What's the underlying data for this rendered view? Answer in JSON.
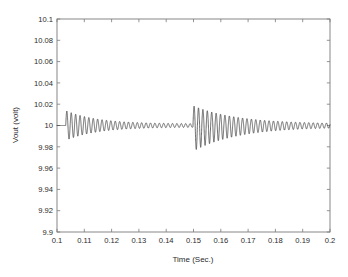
{
  "figure": {
    "background_color": "#ffffff",
    "axes_color": "#7a7a7a",
    "line_color": "#3a3a3a",
    "text_color": "#2b2b2b"
  },
  "chart_data": {
    "type": "line",
    "title": "",
    "xlabel": "Time (Sec.)",
    "ylabel": "Vout (volt)",
    "xlim": [
      0.1,
      0.2
    ],
    "ylim": [
      9.9,
      10.1
    ],
    "grid": false,
    "legend": null,
    "xticks": [
      0.1,
      0.11,
      0.12,
      0.13,
      0.14,
      0.15,
      0.16,
      0.17,
      0.18,
      0.19,
      0.2
    ],
    "xticklabels": [
      "0.1",
      "0.11",
      "0.12",
      "0.13",
      "0.14",
      "0.15",
      "0.16",
      "0.17",
      "0.18",
      "0.19",
      "0.2"
    ],
    "yticks": [
      9.9,
      9.92,
      9.94,
      9.96,
      9.98,
      10,
      10.02,
      10.04,
      10.06,
      10.08,
      10.1
    ],
    "yticklabels": [
      "9.9",
      "9.92",
      "9.94",
      "9.96",
      "9.98",
      "10",
      "10.02",
      "10.04",
      "10.06",
      "10.08",
      "10.1"
    ],
    "series": [
      {
        "name": "Vout",
        "description": "Damped oscillatory output voltage with two transient events",
        "steady_state_value": 10.0,
        "events": [
          {
            "name": "first-transient",
            "start_time": 0.1032,
            "peak_high": 10.0125,
            "peak_low": 9.9875,
            "oscillation_frequency_hz": 620,
            "decay_time_constant_s": 0.0115,
            "settle_time": 0.14
          },
          {
            "name": "second-transient",
            "start_time": 0.1498,
            "peak_high": 10.0172,
            "peak_low": 9.9772,
            "oscillation_frequency_hz": 620,
            "decay_time_constant_s": 0.0165,
            "settle_time": 0.2
          }
        ],
        "residual_ripple_amplitude": 0.0015
      }
    ]
  },
  "tick_label_values": {
    "y": [
      "10.1",
      "10.08",
      "10.06",
      "10.04",
      "10.02",
      "10",
      "9.98",
      "9.96",
      "9.94",
      "9.92",
      "9.9"
    ],
    "x": [
      "0.1",
      "0.11",
      "0.12",
      "0.13",
      "0.14",
      "0.15",
      "0.16",
      "0.17",
      "0.18",
      "0.19",
      "0.2"
    ]
  }
}
